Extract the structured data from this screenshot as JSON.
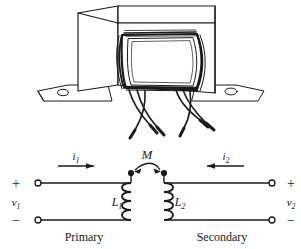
{
  "figure": {
    "name": "mutual-inductance-transformer-figure",
    "background": "#ffffff",
    "ink": "#1a1a1a"
  },
  "photo": {
    "caption_alt": "line-art drawing of an iron-core transformer with mounting brackets and six wire leads",
    "parts": {
      "core_label": "laminated-core",
      "bracket_label": "mounting-bracket",
      "lead_count": 6
    }
  },
  "circuit": {
    "mutual_inductance_label": "M",
    "primary": {
      "section_label": "Primary",
      "inductor_label": "L",
      "inductor_sub": "1",
      "current_label": "i",
      "current_sub": "1",
      "voltage_label": "v",
      "voltage_sub": "1",
      "polarity_top": "+",
      "polarity_bottom": "−",
      "current_direction": "right"
    },
    "secondary": {
      "section_label": "Secondary",
      "inductor_label": "L",
      "inductor_sub": "2",
      "current_label": "i",
      "current_sub": "2",
      "voltage_label": "v",
      "voltage_sub": "2",
      "polarity_top": "+",
      "polarity_bottom": "−",
      "current_direction": "left"
    },
    "dots": {
      "left_dot": "polarity-dot-primary",
      "right_dot": "polarity-dot-secondary"
    }
  }
}
